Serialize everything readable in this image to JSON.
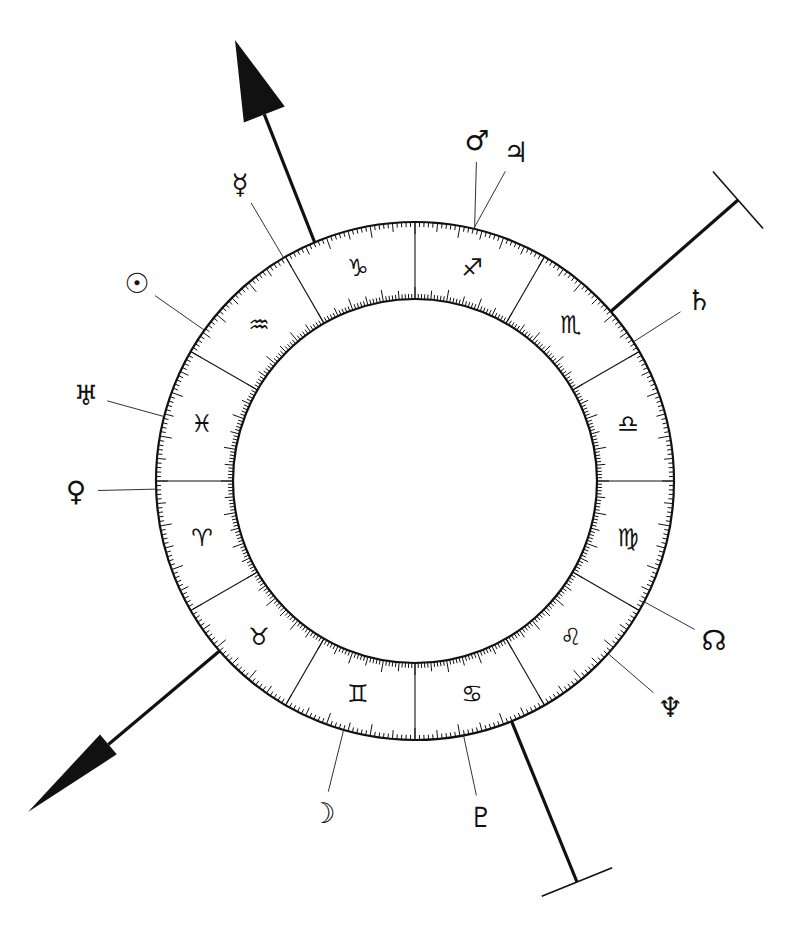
{
  "chart_data": {
    "type": "diagram",
    "center": [
      415,
      481
    ],
    "outer_radius": 259,
    "inner_radius": 182,
    "colors": {
      "ink": "#111111",
      "background": "#ffffff",
      "pointer_line": "#333333"
    },
    "zodiac_orientation": "Aries begins at left horizontal (180°), signs proceed counter-clockwise",
    "signs": [
      {
        "name": "Aries",
        "glyph": "♈",
        "start_deg": 0
      },
      {
        "name": "Taurus",
        "glyph": "♉",
        "start_deg": 30
      },
      {
        "name": "Gemini",
        "glyph": "♊",
        "start_deg": 60
      },
      {
        "name": "Cancer",
        "glyph": "♋",
        "start_deg": 90
      },
      {
        "name": "Leo",
        "glyph": "♌",
        "start_deg": 120
      },
      {
        "name": "Virgo",
        "glyph": "♍",
        "start_deg": 150
      },
      {
        "name": "Libra",
        "glyph": "♎",
        "start_deg": 180
      },
      {
        "name": "Scorpio",
        "glyph": "♏",
        "start_deg": 210
      },
      {
        "name": "Sagittarius",
        "glyph": "♐",
        "start_deg": 240
      },
      {
        "name": "Capricorn",
        "glyph": "♑",
        "start_deg": 270
      },
      {
        "name": "Aquarius",
        "glyph": "♒",
        "start_deg": 300
      },
      {
        "name": "Pisces",
        "glyph": "♓",
        "start_deg": 330
      }
    ],
    "planets": [
      {
        "name": "Mercury",
        "glyph": "☿",
        "longitude": 300.5,
        "label_xy": [
          240,
          184
        ]
      },
      {
        "name": "Sun",
        "glyph": "☉",
        "longitude": 324.4,
        "label_xy": [
          137,
          283
        ]
      },
      {
        "name": "Uranus",
        "glyph": "♅",
        "longitude": 345.6,
        "label_xy": [
          86,
          395
        ]
      },
      {
        "name": "Venus",
        "glyph": "♀",
        "longitude": 1.8,
        "label_xy": [
          76,
          491
        ]
      },
      {
        "name": "Moon",
        "glyph": "☽",
        "longitude": 74,
        "label_xy": [
          323,
          813
        ]
      },
      {
        "name": "Pluto",
        "glyph": "♇",
        "longitude": 100.8,
        "label_xy": [
          481,
          817
        ]
      },
      {
        "name": "Neptune",
        "glyph": "♆",
        "longitude": 138.2,
        "label_xy": [
          670,
          707
        ]
      },
      {
        "name": "North Node",
        "glyph": "☊",
        "longitude": 152.2,
        "label_xy": [
          714,
          640
        ]
      },
      {
        "name": "Saturn",
        "glyph": "♄",
        "longitude": 212.5,
        "label_xy": [
          699,
          300
        ]
      },
      {
        "name": "Mars",
        "glyph": "♂",
        "longitude": 256.7,
        "label_xy": [
          477,
          140
        ]
      },
      {
        "name": "Jupiter",
        "glyph": "♃",
        "longitude": 256.9,
        "label_xy": [
          516,
          152
        ]
      }
    ],
    "angles": [
      {
        "name": "MC arrow",
        "type": "arrow",
        "longitude": 292.8,
        "end_xy": [
          235,
          40
        ]
      },
      {
        "name": "IC arrow",
        "type": "arrow",
        "longitude": 41,
        "end_xy": [
          28,
          812
        ]
      },
      {
        "name": "Axis bar upper-right",
        "type": "bar",
        "longitude": 220.9,
        "end_xy": [
          738,
          200
        ]
      },
      {
        "name": "Axis bar bottom",
        "type": "bar",
        "longitude": 111.9,
        "end_xy": [
          577,
          882
        ]
      }
    ],
    "ticks": {
      "minor_every_deg": 1,
      "medium_every_deg": 5,
      "major_every_deg": 10
    }
  }
}
